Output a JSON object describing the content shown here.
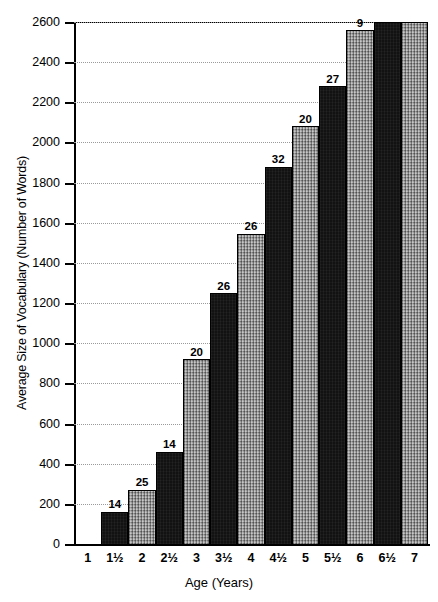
{
  "chart_data": {
    "type": "bar",
    "title": "",
    "xlabel": "Age (Years)",
    "ylabel": "Average Size of Vocabulary (Number of Words)",
    "categories": [
      "1",
      "1½",
      "2",
      "2½",
      "3",
      "3½",
      "4",
      "4½",
      "5",
      "5½",
      "6",
      "6½",
      "7"
    ],
    "values": [
      3,
      160,
      270,
      460,
      920,
      1250,
      1545,
      1880,
      2080,
      2280,
      2560,
      2600,
      2600
    ],
    "point_labels": [
      "",
      "14",
      "25",
      "14",
      "20",
      "26",
      "26",
      "32",
      "20",
      "27",
      "9",
      "",
      ""
    ],
    "ylim": [
      0,
      2600
    ],
    "ytick_labels": [
      "0",
      "200",
      "400",
      "600",
      "800",
      "1000",
      "1200",
      "1400",
      "1600",
      "1800",
      "2000",
      "2200",
      "2400",
      "2600"
    ],
    "ytick_values": [
      0,
      200,
      400,
      600,
      800,
      1000,
      1200,
      1400,
      1600,
      1800,
      2000,
      2200,
      2400,
      2600
    ],
    "grid": true,
    "legend": "none",
    "bar_fills": [
      "light",
      "dark",
      "light",
      "dark",
      "light",
      "dark",
      "light",
      "dark",
      "light",
      "dark",
      "light",
      "dark",
      "light"
    ],
    "colors": {
      "dark_bar": "#121212",
      "light_bar": "#9d9d9d",
      "axis": "#000000",
      "gridline": "#9a9a9a",
      "background": "#ffffff"
    }
  }
}
